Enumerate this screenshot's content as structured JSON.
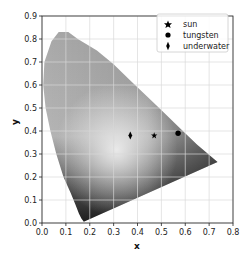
{
  "chart_data": {
    "type": "scatter",
    "title": "",
    "xlabel": "x",
    "ylabel": "y",
    "xlim": [
      0.0,
      0.8
    ],
    "ylim": [
      0.0,
      0.9
    ],
    "grid": true,
    "legend_position": "upper right",
    "x_ticks": [
      "0.0",
      "0.1",
      "0.2",
      "0.3",
      "0.4",
      "0.5",
      "0.6",
      "0.7",
      "0.8"
    ],
    "y_ticks": [
      "0.0",
      "0.1",
      "0.2",
      "0.3",
      "0.4",
      "0.5",
      "0.6",
      "0.7",
      "0.8",
      "0.9"
    ],
    "background": "CIE 1931 chromaticity diagram (grayscale)",
    "series": [
      {
        "name": "sun",
        "marker": "star",
        "x": 0.47,
        "y": 0.38
      },
      {
        "name": "tungsten",
        "marker": "circle",
        "x": 0.57,
        "y": 0.39
      },
      {
        "name": "underwater",
        "marker": "thin-diamond",
        "x": 0.37,
        "y": 0.38
      }
    ],
    "spectral_locus": [
      [
        0.175,
        0.005
      ],
      [
        0.165,
        0.02
      ],
      [
        0.155,
        0.04
      ],
      [
        0.14,
        0.08
      ],
      [
        0.12,
        0.13
      ],
      [
        0.09,
        0.2
      ],
      [
        0.06,
        0.3
      ],
      [
        0.035,
        0.4
      ],
      [
        0.015,
        0.5
      ],
      [
        0.005,
        0.6
      ],
      [
        0.01,
        0.7
      ],
      [
        0.04,
        0.79
      ],
      [
        0.07,
        0.83
      ],
      [
        0.11,
        0.83
      ],
      [
        0.15,
        0.8
      ],
      [
        0.23,
        0.75
      ],
      [
        0.3,
        0.69
      ],
      [
        0.37,
        0.62
      ],
      [
        0.44,
        0.55
      ],
      [
        0.51,
        0.48
      ],
      [
        0.58,
        0.41
      ],
      [
        0.65,
        0.34
      ],
      [
        0.735,
        0.265
      ]
    ]
  },
  "legend": {
    "items": [
      {
        "label": "sun",
        "marker": "star"
      },
      {
        "label": "tungsten",
        "marker": "circle"
      },
      {
        "label": "underwater",
        "marker": "thin-diamond"
      }
    ]
  },
  "colors": {
    "marker": "#000000",
    "grid": "#d9d9d9",
    "axis": "#222222"
  }
}
